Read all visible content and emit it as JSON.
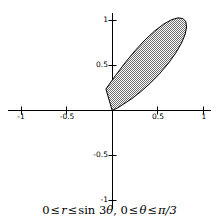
{
  "figure": {
    "width": 219,
    "height": 219,
    "background": "#ffffff",
    "caption_parts": {
      "zero_a": "0",
      "rel_a": "≤",
      "r": "r",
      "rel_b": "≤",
      "sin": "sin",
      "three": "3",
      "theta_a": "θ",
      "comma": ",",
      "zero_b": "0",
      "rel_c": "≤",
      "theta_b": "θ",
      "rel_d": "≤",
      "pi_over_three": "π/3"
    },
    "caption_text": "0 ≤ r ≤ sin 3θ, 0 ≤ θ ≤ π/3"
  },
  "axes": {
    "origin_px": {
      "x": 112,
      "y": 110
    },
    "scale_px_per_unit": {
      "x": 91,
      "y": 90
    },
    "xlim": [
      -1.12,
      1.12
    ],
    "ylim": [
      -1.12,
      1.12
    ],
    "grid": false,
    "axis_color": "#000000",
    "x_ticks": [
      {
        "value": -1,
        "label": "-1"
      },
      {
        "value": -0.5,
        "label": "-0.5"
      },
      {
        "value": 0.5,
        "label": "0.5"
      },
      {
        "value": 1,
        "label": "1"
      }
    ],
    "y_ticks": [
      {
        "value": 1,
        "label": "1"
      },
      {
        "value": 0.5,
        "label": "0.5"
      },
      {
        "value": -0.5,
        "label": "-0.5"
      },
      {
        "value": -1,
        "label": "-1"
      }
    ]
  },
  "chart_data": {
    "type": "line",
    "title": "",
    "subtitle": "",
    "xlabel": "",
    "ylabel": "",
    "xlim": [
      -1.12,
      1.12
    ],
    "ylim": [
      -1.12,
      1.12
    ],
    "grid": false,
    "legend": null,
    "coordinate_system": "polar-overlaid-on-cartesian",
    "annotations": [
      "0 ≤ r ≤ sin 3θ, 0 ≤ θ ≤ π/3"
    ],
    "series": [
      {
        "name": "r = sin(3θ), 0 ≤ θ ≤ π/3",
        "equation_polar": "r = sin(3*theta)",
        "theta_range_rad": [
          0,
          1.0471975512
        ],
        "r_max": 1,
        "r_max_at_theta_rad": 0.5235987756,
        "fill": "hatched-checkerboard-gray",
        "fill_color": "#9a9a9a",
        "stroke_color": "#000000",
        "stroke_width": 1,
        "closed": true,
        "points_xy": [
          [
            0.0,
            0.0
          ],
          [
            0.01519,
            0.00266
          ],
          [
            0.05905,
            0.02094
          ],
          [
            0.12814,
            0.06624
          ],
          [
            0.21651,
            0.125
          ],
          [
            0.31732,
            0.20442
          ],
          [
            0.42329,
            0.30052
          ],
          [
            0.52721,
            0.40839
          ],
          [
            0.62241,
            0.52246
          ],
          [
            0.70313,
            0.63683
          ],
          [
            0.76485,
            0.74549
          ],
          [
            0.80438,
            0.84268
          ],
          [
            0.81996,
            0.92311
          ],
          [
            0.81116,
            0.98226
          ],
          [
            0.7789,
            1.01659
          ],
          [
            0.72521,
            1.02371
          ],
          [
            0.65301,
            1.00251
          ],
          [
            0.56585,
            0.95323
          ],
          [
            0.4676,
            0.87745
          ],
          [
            0.36216,
            0.77798
          ],
          [
            0.25316,
            0.65877
          ],
          [
            0.14376,
            0.52465
          ],
          [
            0.03654,
            0.38104
          ],
          [
            -0.06659,
            0.23368
          ],
          [
            0.0,
            0.0
          ]
        ],
        "points_xy_note": "Cartesian outline of the petal r=sin(3θ) over θ∈[0,π/3]; lobe axis at θ=π/6 with tip at (cos30°, sin30°)=(0.866,0.5) scaled by r=1"
      }
    ]
  }
}
